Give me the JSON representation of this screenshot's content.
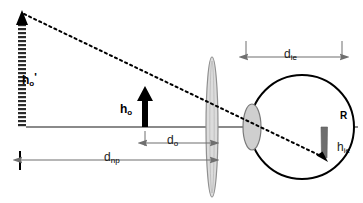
{
  "figure": {
    "type": "optics-ray-diagram",
    "width": 363,
    "height": 203,
    "background_color": "#ffffff"
  },
  "colors": {
    "axis": "#8a8a8a",
    "outline": "#000000",
    "lens_fill": "#d6d6d6",
    "lens_stroke": "#8c8c8c",
    "cornea_fill": "#cfcfcf",
    "cornea_stroke": "#7a7a7a",
    "retina_image_fill": "#6e6e6e",
    "dimension_line": "#6f6f6f",
    "ray": "#000000",
    "object_arrow": "#000000"
  },
  "labels": {
    "object_virtual_height": {
      "base": "h",
      "sub": "o",
      "prime": "'",
      "name": "virtual object height at near point"
    },
    "object_height": {
      "base": "h",
      "sub": "o",
      "name": "object height"
    },
    "object_distance": {
      "base": "d",
      "sub": "o",
      "name": "object distance to lens"
    },
    "near_point_distance": {
      "base": "d",
      "sub": "np",
      "name": "near point distance"
    },
    "image_eye_distance": {
      "base": "d",
      "sub": "ie",
      "name": "distance from cornea to retina"
    },
    "image_eye_height": {
      "base": "h",
      "sub": "ie",
      "name": "image height on retina"
    },
    "retina": {
      "base": "R",
      "name": "retina"
    }
  },
  "elements": {
    "optical_axis": {
      "y": 127,
      "x_start": 18,
      "x_end": 358
    },
    "hatched_arrow": {
      "x": 22,
      "y_top": 12,
      "y_bottom": 127,
      "style": "striped"
    },
    "object_arrow": {
      "x": 145,
      "y_top": 90,
      "y_bottom": 127,
      "style": "solid"
    },
    "magnifier_lens": {
      "cx": 212,
      "cy": 127,
      "rx": 6,
      "ry": 70
    },
    "eyeball": {
      "cx": 302,
      "cy": 127,
      "r": 52
    },
    "cornea": {
      "cx": 252,
      "cy": 127,
      "rx": 9,
      "ry": 23
    },
    "retina_image": {
      "x": 321,
      "y_top": 127,
      "y_bottom": 160
    },
    "principal_ray": {
      "x1": 22,
      "y1": 14,
      "x2": 327,
      "y2": 160,
      "style": "dotted"
    },
    "dimension_die": {
      "y": 57,
      "x_start": 246,
      "x_end": 342
    },
    "dimension_do": {
      "y": 143,
      "x_start": 145,
      "x_end": 212
    },
    "dimension_dnp": {
      "y": 160,
      "x_start": 20,
      "x_end": 212
    }
  }
}
